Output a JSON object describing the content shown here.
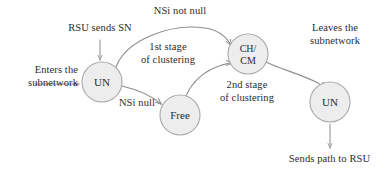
{
  "figure": {
    "type": "state-transition-diagram",
    "background": "#ffffff",
    "node_fill": "#ededed",
    "node_stroke": "#a8a8a8",
    "edge_stroke": "#8c8c8c",
    "text_color": "#2b2b2b"
  },
  "nodes": [
    {
      "id": "un-left",
      "label": "UN",
      "label_lines": [
        "UN"
      ],
      "cx": 102,
      "cy": 82,
      "r": 20
    },
    {
      "id": "free",
      "label": "Free",
      "label_lines": [
        "Free"
      ],
      "cx": 180,
      "cy": 115,
      "r": 20
    },
    {
      "id": "ch-cm",
      "label": "CH/CM",
      "label_lines": [
        "CH/",
        "CM"
      ],
      "cx": 248,
      "cy": 54,
      "r": 20
    },
    {
      "id": "un-right",
      "label": "UN",
      "label_lines": [
        "UN"
      ],
      "cx": 330,
      "cy": 102,
      "r": 20
    }
  ],
  "labels": {
    "enters_subnetwork": "Enters the\nsubnetwork",
    "enters_subnetwork_line1": "Enters the",
    "enters_subnetwork_line2": "subnetwork",
    "rsu_sends_sn": "RSU sends SN",
    "nsi_not_null": "NSi not null",
    "first_stage_line1": "1st stage",
    "first_stage_line2": "of clustering",
    "nsi_null": "NSi null",
    "second_stage_line1": "2nd stage",
    "second_stage_line2": "of clustering",
    "leaves_subnetwork_line1": "Leaves the",
    "leaves_subnetwork_line2": "subnetwork",
    "sends_path_to_rsu": "Sends path to RSU"
  },
  "edges": [
    {
      "id": "enter-arrow",
      "from": "external",
      "to": "un-left",
      "label": "Enters the subnetwork"
    },
    {
      "id": "rsu-arrow",
      "from": "external",
      "to": "un-left",
      "label": "RSU sends SN"
    },
    {
      "id": "un-to-chcm",
      "from": "un-left",
      "to": "ch-cm",
      "label": "NSi not null / 1st stage of clustering"
    },
    {
      "id": "un-to-free",
      "from": "un-left",
      "to": "free",
      "label": "NSi null"
    },
    {
      "id": "free-to-chcm",
      "from": "free",
      "to": "ch-cm",
      "label": "2nd stage of clustering"
    },
    {
      "id": "chcm-to-unright",
      "from": "ch-cm",
      "to": "un-right",
      "label": "Leaves the subnetwork"
    },
    {
      "id": "unright-to-rsu",
      "from": "un-right",
      "to": "external",
      "label": "Sends path to RSU"
    }
  ]
}
